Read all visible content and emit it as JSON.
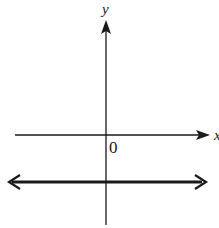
{
  "diagram": {
    "type": "coordinate-plane",
    "axes": {
      "x_label": "x",
      "y_label": "y",
      "origin_label": "0"
    },
    "line": {
      "kind": "horizontal",
      "position": "below x-axis",
      "arrows": "both ends"
    },
    "colors": {
      "ink": "#1a1a1a",
      "background": "#ffffff"
    }
  }
}
